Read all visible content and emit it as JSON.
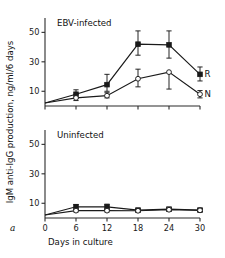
{
  "figure": {
    "letter": "a",
    "xlabel": "Days in culture",
    "ylabel": "IgM anti-IgG production, ng/ml/6 days"
  },
  "chart_data": {
    "type": "line",
    "xlabel": "Days in culture",
    "ylabel": "IgM anti-IgG production, ng/ml/6 days",
    "x": [
      0,
      6,
      12,
      18,
      24,
      30
    ],
    "xlim": [
      0,
      30
    ],
    "ylim": [
      0,
      55
    ],
    "xticks": [
      0,
      6,
      12,
      18,
      24,
      30
    ],
    "yticks": [
      10,
      30,
      50
    ],
    "grid": false,
    "legend_position": "inline-right",
    "panels": [
      {
        "name": "EBV-infected",
        "label": "EBV-infected",
        "series": [
          {
            "name": "R",
            "label": "R",
            "marker": "filled-square",
            "values": [
              2.0,
              8.0,
              14.5,
              42.0,
              41.5,
              21.5
            ],
            "err_low": [
              0.0,
              2.8,
              4.5,
              7.5,
              9.0,
              4.5
            ],
            "err_high": [
              0.0,
              3.0,
              7.0,
              9.0,
              9.5,
              5.0
            ]
          },
          {
            "name": "N",
            "label": "N",
            "marker": "open-circle",
            "values": [
              2.0,
              5.5,
              7.0,
              18.5,
              23.0,
              8.0
            ],
            "err_low": [
              0.0,
              1.8,
              1.5,
              5.5,
              11.5,
              2.5
            ],
            "err_high": [
              0.0,
              2.2,
              2.0,
              6.5,
              0.0,
              2.5
            ]
          }
        ]
      },
      {
        "name": "Uninfected",
        "label": "Uninfected",
        "series": [
          {
            "name": "R",
            "label": "R",
            "marker": "filled-square",
            "values": [
              2.0,
              7.6,
              7.6,
              5.4,
              6.0,
              5.4
            ],
            "err_low": [
              0.0,
              1.6,
              1.6,
              0.9,
              1.0,
              0.9
            ],
            "err_high": [
              0.0,
              1.6,
              1.8,
              1.0,
              1.2,
              1.0
            ]
          },
          {
            "name": "N",
            "label": "N",
            "marker": "open-circle",
            "values": [
              2.0,
              5.0,
              5.0,
              4.9,
              5.6,
              5.2
            ],
            "err_low": [
              0.0,
              0.9,
              0.9,
              0.8,
              0.9,
              0.9
            ],
            "err_high": [
              0.0,
              0.9,
              0.9,
              0.8,
              0.9,
              0.9
            ]
          }
        ]
      }
    ]
  }
}
